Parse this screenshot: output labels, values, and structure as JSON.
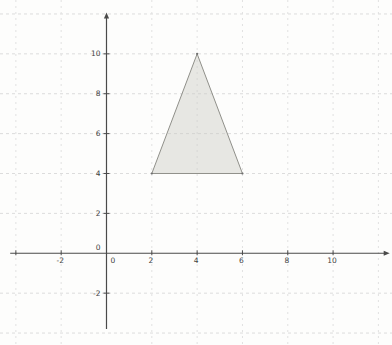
{
  "canvas": {
    "width": 392,
    "height": 345,
    "background": "#fdfdfc"
  },
  "chart_data": {
    "type": "polygon",
    "title": "",
    "xlabel": "",
    "ylabel": "",
    "xlim": [
      -4.7,
      12.6
    ],
    "ylim": [
      -4.6,
      12.7
    ],
    "grid": {
      "show": true,
      "step": 2,
      "style": "dashed",
      "x_lines": [
        -4,
        -2,
        2,
        4,
        6,
        8,
        10,
        12
      ],
      "y_lines": [
        -4,
        -2,
        2,
        4,
        6,
        8,
        10,
        12
      ],
      "color_horizontal": "#dcdcdc",
      "color_vertical": "#e1e1e1"
    },
    "axes": {
      "color": "#4a4a4a",
      "x_start": -4.25,
      "x_end": 12.3,
      "y_start": -3.8,
      "y_end": 11.85,
      "x_ticks": [
        -4,
        -2,
        2,
        4,
        6,
        8,
        10
      ],
      "y_ticks": [
        -2,
        2,
        4,
        6,
        8,
        10
      ],
      "x_labels": [
        {
          "value": -2,
          "text": "-2"
        },
        {
          "value": 0,
          "text": "0"
        },
        {
          "value": 2,
          "text": "2"
        },
        {
          "value": 4,
          "text": "4"
        },
        {
          "value": 6,
          "text": "6"
        },
        {
          "value": 8,
          "text": "8"
        },
        {
          "value": 10,
          "text": "10"
        }
      ],
      "y_labels": [
        {
          "value": -2,
          "text": "-2"
        },
        {
          "value": 0,
          "text": "0"
        },
        {
          "value": 2,
          "text": "2"
        },
        {
          "value": 4,
          "text": "4"
        },
        {
          "value": 6,
          "text": "6"
        },
        {
          "value": 8,
          "text": "8"
        },
        {
          "value": 10,
          "text": "10"
        }
      ],
      "label_color": "#3f3f3f",
      "label_font_size": 7.5
    },
    "series": [
      {
        "name": "triangle",
        "type": "polygon",
        "vertices": [
          [
            2,
            4
          ],
          [
            6,
            4
          ],
          [
            4,
            10
          ]
        ],
        "fill": "#ccccc5",
        "fill_opacity": 0.45,
        "stroke": "#90908a",
        "stroke_width": 1,
        "vertex_color": "#6f6f6f"
      }
    ]
  }
}
